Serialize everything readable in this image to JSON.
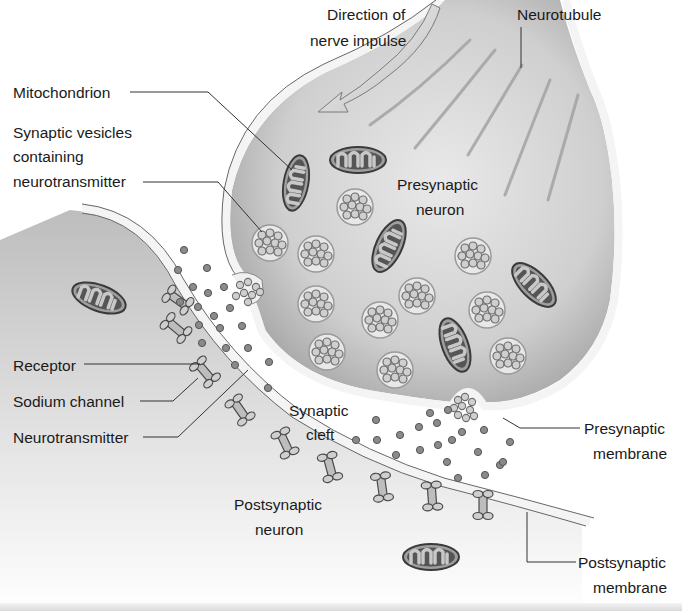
{
  "diagram": {
    "labels": {
      "direction_line1": "Direction of",
      "direction_line2": "nerve impulse",
      "neurotubule": "Neurotubule",
      "mitochondrion": "Mitochondrion",
      "vesicles_line1": "Synaptic vesicles",
      "vesicles_line2": "containing",
      "vesicles_line3": "neurotransmitter",
      "presynaptic_neuron_line1": "Presynaptic",
      "presynaptic_neuron_line2": "neuron",
      "receptor": "Receptor",
      "sodium_channel": "Sodium channel",
      "neurotransmitter": "Neurotransmitter",
      "synaptic_cleft_line1": "Synaptic",
      "synaptic_cleft_line2": "cleft",
      "presynaptic_membrane_line1": "Presynaptic",
      "presynaptic_membrane_line2": "membrane",
      "postsynaptic_neuron_line1": "Postsynaptic",
      "postsynaptic_neuron_line2": "neuron",
      "postsynaptic_membrane_line1": "Postsynaptic",
      "postsynaptic_membrane_line2": "membrane"
    },
    "colors": {
      "cytoplasm": "#cfcfcf",
      "membrane": "#f2f2f2",
      "outline": "#555555",
      "vesicle_fill": "#e6e6e6",
      "particle": "#8a8a8a",
      "text": "#1a1a1a"
    }
  }
}
